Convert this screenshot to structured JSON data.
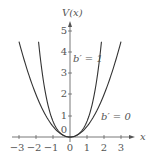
{
  "chart_data": {
    "type": "line",
    "title": "",
    "xlabel": "x",
    "ylabel": "V(x)",
    "xlim": [
      -3.4,
      3.4
    ],
    "ylim": [
      0,
      5.3
    ],
    "x_ticks": [
      "−3",
      "−2",
      "−1",
      "0",
      "1",
      "2",
      "3"
    ],
    "y_ticks": [
      "0",
      "1",
      "2",
      "3",
      "4",
      "5"
    ],
    "grid": false,
    "series": [
      {
        "name": "b′ = 0",
        "formula": "V = 0.5 x^2",
        "x": [
          -3,
          -2,
          -1,
          0,
          1,
          2,
          3
        ],
        "values": [
          4.5,
          2,
          0.5,
          0,
          0.5,
          2,
          4.5
        ]
      },
      {
        "name": "b′ = 1",
        "formula": "V = 0.5 x^2 + 0.25 x^4 (steeper)",
        "x": [
          -1.85,
          -1,
          0,
          1,
          1.85
        ],
        "values": [
          5,
          1.1,
          0,
          1.1,
          5
        ]
      }
    ],
    "annotations": [
      {
        "text": "b′ = 1",
        "x": 0.5,
        "y": 3.8
      },
      {
        "text": "b′ = 0",
        "x": 1.9,
        "y": 1.0
      }
    ]
  },
  "labels": {
    "ylabel": "V(x)",
    "xlabel": "x",
    "b1": "b′ = 1",
    "b0": "b′ = 0"
  }
}
